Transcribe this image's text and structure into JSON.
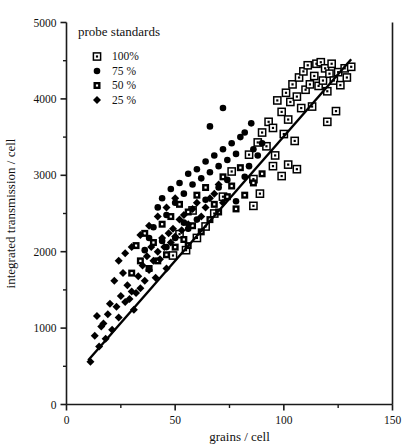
{
  "chart_data": {
    "type": "scatter",
    "title": "",
    "xlabel": "grains / cell",
    "ylabel": "integrated transmission / cell",
    "xlim": [
      0,
      150
    ],
    "ylim": [
      0,
      5000
    ],
    "xticks": [
      0,
      50,
      100,
      150
    ],
    "xticklabels": [
      "0",
      "50",
      "100",
      "150"
    ],
    "xminorticks": [
      25,
      75,
      125
    ],
    "yticks": [
      0,
      1000,
      2000,
      3000,
      4000,
      5000
    ],
    "yticklabels": [
      "0",
      "1000",
      "2000",
      "3000",
      "4000",
      "5000"
    ],
    "yminorticks": [
      500,
      1500,
      2500,
      3500,
      4500
    ],
    "grid": false,
    "legend": {
      "title": "probe standards",
      "position": "upper-left-inside",
      "entries": [
        {
          "label": "100%",
          "marker": "open-square-dot"
        },
        {
          "label": "75 %",
          "marker": "filled-circle"
        },
        {
          "label": "50 %",
          "marker": "filled-square-dot"
        },
        {
          "label": "25 %",
          "marker": "filled-diamond"
        }
      ]
    },
    "fit_line": {
      "label": "linear regression",
      "x_start": 10,
      "y_start": 580,
      "x_end": 131,
      "y_end": 4520,
      "color": "#000000",
      "width": 2.4
    },
    "series": [
      {
        "name": "100%",
        "marker": "open-square-dot",
        "color": "#000000",
        "points": [
          [
            76,
            3050
          ],
          [
            84,
            3270
          ],
          [
            86,
            2950
          ],
          [
            88,
            3430
          ],
          [
            90,
            3560
          ],
          [
            92,
            3380
          ],
          [
            93,
            3700
          ],
          [
            95,
            3620
          ],
          [
            96,
            3260
          ],
          [
            97,
            3980
          ],
          [
            99,
            3830
          ],
          [
            100,
            3540
          ],
          [
            101,
            4080
          ],
          [
            102,
            3730
          ],
          [
            103,
            3960
          ],
          [
            104,
            4190
          ],
          [
            105,
            3450
          ],
          [
            106,
            4030
          ],
          [
            107,
            4280
          ],
          [
            108,
            3880
          ],
          [
            109,
            4360
          ],
          [
            110,
            4120
          ],
          [
            111,
            4440
          ],
          [
            112,
            4190
          ],
          [
            113,
            3900
          ],
          [
            114,
            4300
          ],
          [
            115,
            4460
          ],
          [
            116,
            4170
          ],
          [
            117,
            4480
          ],
          [
            118,
            4240
          ],
          [
            119,
            4400
          ],
          [
            120,
            4100
          ],
          [
            121,
            4330
          ],
          [
            122,
            4460
          ],
          [
            123,
            4240
          ],
          [
            125,
            4350
          ],
          [
            126,
            4180
          ],
          [
            128,
            4400
          ],
          [
            129,
            4280
          ],
          [
            131,
            4420
          ],
          [
            95,
            3120
          ],
          [
            99,
            2990
          ],
          [
            102,
            3140
          ],
          [
            106,
            3080
          ],
          [
            86,
            2600
          ],
          [
            89,
            2760
          ],
          [
            72,
            2720
          ],
          [
            68,
            2500
          ],
          [
            64,
            2330
          ],
          [
            60,
            2180
          ],
          [
            58,
            2540
          ],
          [
            55,
            2020
          ],
          [
            52,
            2230
          ],
          [
            49,
            1950
          ],
          [
            120,
            3700
          ],
          [
            124,
            3840
          ]
        ]
      },
      {
        "name": "75 %",
        "marker": "filled-circle",
        "color": "#000000",
        "points": [
          [
            42,
            2580
          ],
          [
            44,
            2700
          ],
          [
            46,
            2480
          ],
          [
            48,
            2820
          ],
          [
            50,
            2640
          ],
          [
            52,
            2900
          ],
          [
            54,
            2760
          ],
          [
            56,
            3020
          ],
          [
            58,
            2880
          ],
          [
            60,
            3080
          ],
          [
            62,
            2960
          ],
          [
            64,
            3180
          ],
          [
            66,
            3040
          ],
          [
            68,
            3260
          ],
          [
            70,
            3120
          ],
          [
            72,
            3340
          ],
          [
            74,
            3200
          ],
          [
            76,
            3420
          ],
          [
            78,
            3280
          ],
          [
            80,
            3500
          ],
          [
            72,
            3880
          ],
          [
            66,
            3640
          ],
          [
            78,
            2660
          ],
          [
            82,
            2980
          ],
          [
            84,
            3120
          ],
          [
            86,
            3340
          ],
          [
            60,
            2420
          ],
          [
            56,
            2300
          ],
          [
            50,
            2180
          ],
          [
            46,
            2060
          ],
          [
            88,
            3260
          ],
          [
            90,
            3420
          ],
          [
            40,
            2320
          ],
          [
            38,
            2180
          ],
          [
            36,
            2020
          ],
          [
            44,
            2140
          ],
          [
            82,
            3560
          ],
          [
            85,
            3680
          ],
          [
            70,
            2840
          ],
          [
            74,
            2940
          ],
          [
            64,
            2680
          ],
          [
            54,
            2380
          ]
        ]
      },
      {
        "name": "50 %",
        "marker": "filled-square-dot",
        "color": "#000000",
        "points": [
          [
            36,
            2240
          ],
          [
            40,
            2120
          ],
          [
            44,
            2360
          ],
          [
            48,
            2460
          ],
          [
            52,
            2620
          ],
          [
            56,
            2520
          ],
          [
            60,
            2740
          ],
          [
            64,
            2840
          ],
          [
            68,
            2620
          ],
          [
            72,
            2980
          ],
          [
            76,
            2860
          ],
          [
            80,
            3100
          ],
          [
            56,
            2080
          ],
          [
            62,
            2260
          ],
          [
            66,
            2420
          ],
          [
            70,
            2520
          ],
          [
            46,
            1960
          ],
          [
            50,
            2060
          ],
          [
            34,
            1880
          ],
          [
            38,
            1780
          ],
          [
            42,
            1880
          ],
          [
            74,
            2720
          ],
          [
            78,
            2560
          ],
          [
            82,
            2740
          ],
          [
            30,
            1720
          ],
          [
            32,
            2080
          ],
          [
            58,
            2340
          ],
          [
            54,
            2160
          ],
          [
            86,
            2900
          ],
          [
            90,
            3020
          ]
        ]
      },
      {
        "name": "25 %",
        "marker": "filled-diamond",
        "color": "#000000",
        "points": [
          [
            11,
            560
          ],
          [
            13,
            900
          ],
          [
            15,
            760
          ],
          [
            17,
            1060
          ],
          [
            19,
            1180
          ],
          [
            21,
            980
          ],
          [
            23,
            1280
          ],
          [
            25,
            1420
          ],
          [
            24,
            1140
          ],
          [
            27,
            1340
          ],
          [
            28,
            1560
          ],
          [
            30,
            1480
          ],
          [
            31,
            1240
          ],
          [
            33,
            1680
          ],
          [
            34,
            1520
          ],
          [
            35,
            1820
          ],
          [
            36,
            1620
          ],
          [
            37,
            1940
          ],
          [
            38,
            1760
          ],
          [
            39,
            2060
          ],
          [
            40,
            1880
          ],
          [
            41,
            1660
          ],
          [
            42,
            2000
          ],
          [
            43,
            1900
          ],
          [
            44,
            2180
          ],
          [
            45,
            2060
          ],
          [
            46,
            1780
          ],
          [
            47,
            2240
          ],
          [
            48,
            2120
          ],
          [
            49,
            2300
          ],
          [
            50,
            2200
          ],
          [
            52,
            2420
          ],
          [
            53,
            2280
          ],
          [
            54,
            2480
          ],
          [
            56,
            2360
          ],
          [
            58,
            2560
          ],
          [
            60,
            2640
          ],
          [
            62,
            2460
          ],
          [
            64,
            2580
          ],
          [
            66,
            2700
          ],
          [
            22,
            1620
          ],
          [
            26,
            1720
          ],
          [
            29,
            1380
          ],
          [
            32,
            1460
          ],
          [
            18,
            860
          ],
          [
            20,
            1320
          ],
          [
            16,
            1020
          ],
          [
            14,
            1160
          ],
          [
            68,
            2760
          ],
          [
            70,
            2880
          ],
          [
            72,
            2640
          ],
          [
            24,
            1880
          ],
          [
            27,
            1980
          ],
          [
            30,
            2060
          ],
          [
            34,
            2220
          ],
          [
            38,
            2340
          ],
          [
            42,
            2460
          ],
          [
            46,
            2580
          ],
          [
            50,
            2700
          ]
        ]
      }
    ]
  }
}
